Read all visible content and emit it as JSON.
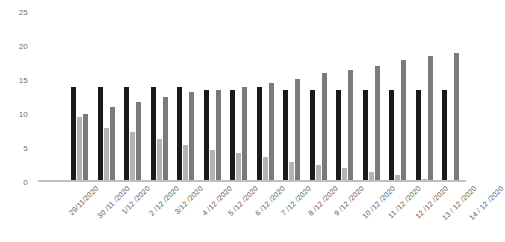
{
  "chart_data": {
    "type": "bar",
    "title": "",
    "subtitle": "",
    "xlabel": "",
    "ylabel": "",
    "ylim": [
      0,
      25
    ],
    "yticks": [
      0,
      5,
      10,
      15,
      20,
      25
    ],
    "grid": false,
    "legend": "none",
    "categories": [
      "29/11/2020",
      "30 /11 /2020",
      "1/12 /2020",
      "2 /12 /2020",
      "3/12 /2020",
      "4 /12 /2020",
      "5 /12 /2020",
      "6 /12 /2020",
      "7 /12 /2020",
      "8 /12 /2020",
      "9 /12 /2020",
      "10 /12 /2020",
      "11 /12 /2020",
      "12 /12 /2020",
      "13 / 12 /2020",
      "14 / 12 /2020"
    ],
    "series": [
      {
        "name": "series-1",
        "color": "#1a1a1a",
        "values": [
          0,
          14,
          14,
          14,
          14,
          14,
          13.5,
          13.5,
          14,
          13.5,
          13.5,
          13.5,
          13.5,
          13.5,
          13.5,
          13.5
        ]
      },
      {
        "name": "series-2",
        "color": "#b3b3b3",
        "values": [
          0,
          9.5,
          8,
          7.3,
          6.3,
          5.5,
          4.7,
          4.3,
          3.7,
          3,
          2.5,
          2,
          1.5,
          1,
          0.4,
          0.3
        ]
      },
      {
        "name": "series-3",
        "color": "#7a7a7a",
        "values": [
          0,
          10,
          11,
          11.8,
          12.5,
          13.2,
          13.5,
          14,
          14.5,
          15.2,
          16,
          16.5,
          17,
          18,
          18.5,
          19
        ]
      }
    ]
  }
}
